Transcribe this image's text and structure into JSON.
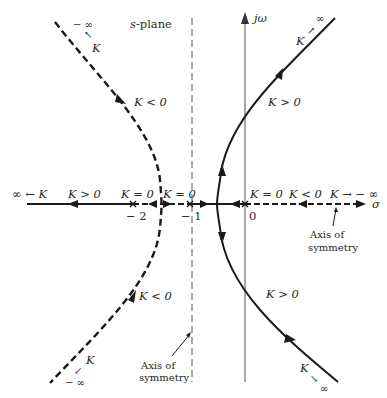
{
  "diagram": {
    "title": "s-plane",
    "axes": {
      "imag_label": "jω",
      "real_label": "σ"
    },
    "poles": [
      {
        "label": "K = 0",
        "tick": "− 2",
        "value": -2
      },
      {
        "label": "K = 0",
        "tick": "− 1",
        "value": -1
      },
      {
        "label": "K = 0",
        "tick": "0",
        "value": 0
      }
    ],
    "branches": {
      "positive_gain": {
        "line_style": "solid",
        "upper_label": "K > 0",
        "lower_label": "K > 0",
        "real_axis_label": "K > 0",
        "upper_end": {
          "k": "K",
          "inf": "∞"
        },
        "lower_end": {
          "k": "K",
          "inf": "∞"
        },
        "left_end": "∞ ← K"
      },
      "negative_gain": {
        "line_style": "dashed",
        "upper_label": "K < 0",
        "lower_label": "K < 0",
        "real_axis_label": "K < 0",
        "upper_end": {
          "k": "K",
          "inf": "− ∞"
        },
        "lower_end": {
          "k": "K",
          "inf": "− ∞"
        },
        "right_end": "K → − ∞"
      }
    },
    "annotations": {
      "vertical_symmetry": [
        "Axis of",
        "symmetry"
      ],
      "horizontal_symmetry": [
        "Axis of",
        "symmetry"
      ]
    },
    "colors": {
      "ink": "#1a1a1a",
      "axis": "#555555",
      "background": "#ffffff"
    }
  }
}
